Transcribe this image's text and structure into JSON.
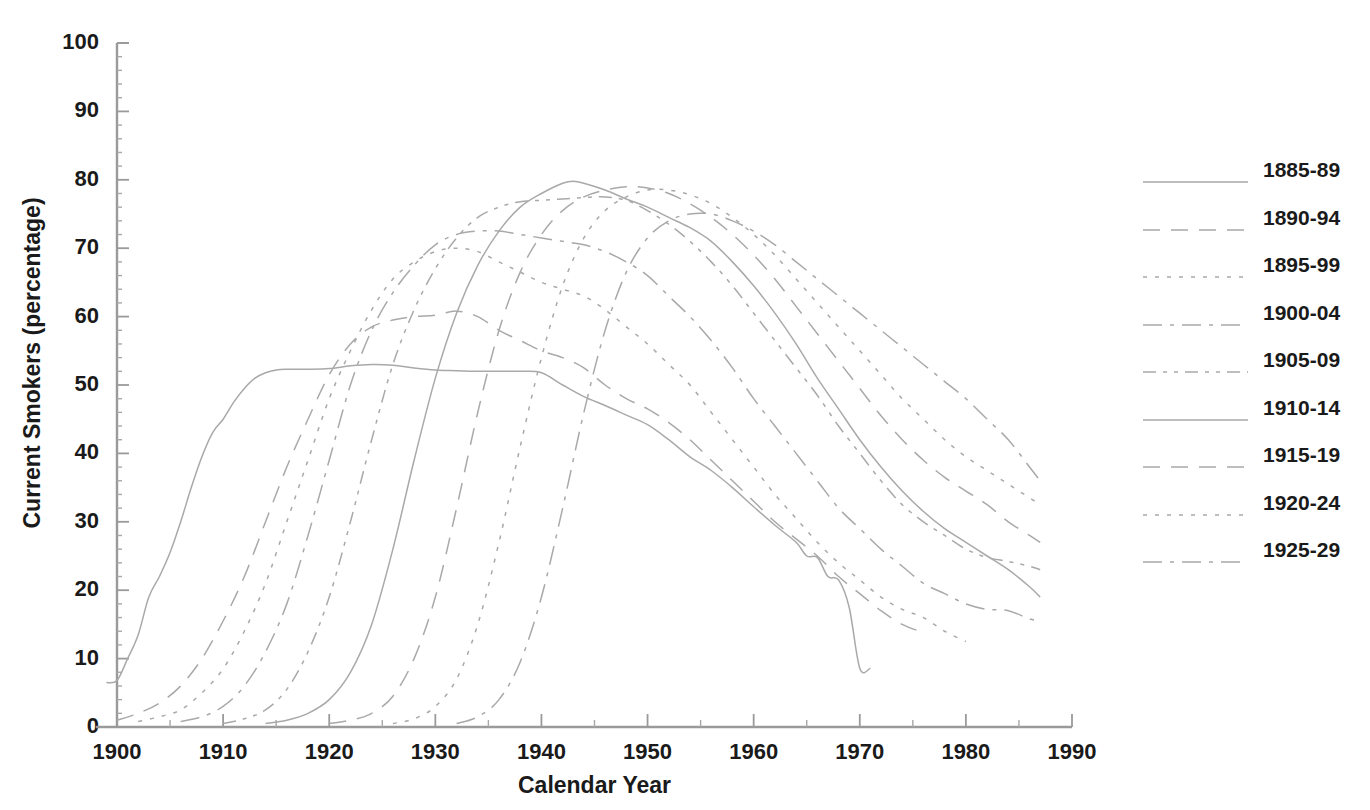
{
  "chart_data": {
    "type": "line",
    "title": "",
    "xlabel": "Calendar Year",
    "ylabel": "Current Smokers (percentage)",
    "xlim": [
      1898,
      1990
    ],
    "ylim": [
      0,
      100
    ],
    "xticks": [
      1900,
      1910,
      1920,
      1930,
      1940,
      1950,
      1960,
      1970,
      1980,
      1990
    ],
    "xtick_labels": [
      "1900",
      "1910",
      "1920",
      "1930",
      "1940",
      "1950",
      "1960",
      "1970",
      "1980",
      "1990"
    ],
    "xminor_interval": 5,
    "yticks": [
      0,
      10,
      20,
      30,
      40,
      50,
      60,
      70,
      80,
      90,
      100
    ],
    "ytick_labels": [
      "0",
      "10",
      "20",
      "30",
      "40",
      "50",
      "60",
      "70",
      "80",
      "90",
      "100"
    ],
    "yminor_interval": 2,
    "grid": false,
    "legend_position": "right",
    "line_color": "#a9a9a9",
    "series": [
      {
        "name": "1885-89",
        "dash": "solid",
        "x": [
          1899,
          1900,
          1901,
          1902,
          1903,
          1904,
          1905,
          1906,
          1907,
          1908,
          1909,
          1910,
          1911,
          1912,
          1913,
          1914,
          1915,
          1916,
          1918,
          1920,
          1922,
          1924,
          1926,
          1928,
          1930,
          1932,
          1934,
          1936,
          1938,
          1940,
          1942,
          1944,
          1946,
          1948,
          1950,
          1952,
          1954,
          1956,
          1958,
          1960,
          1962,
          1964,
          1965,
          1966,
          1967,
          1968,
          1969,
          1970,
          1971
        ],
        "y": [
          6.5,
          6.8,
          10.0,
          13.5,
          19.0,
          22.0,
          25.5,
          30.0,
          35.0,
          39.5,
          43.0,
          45.0,
          47.5,
          49.5,
          51.0,
          51.8,
          52.2,
          52.3,
          52.3,
          52.4,
          52.8,
          53.0,
          52.9,
          52.5,
          52.2,
          52.1,
          52.0,
          52.0,
          52.0,
          51.8,
          50.0,
          48.3,
          47.0,
          45.6,
          44.2,
          42.0,
          39.5,
          37.5,
          35.0,
          32.2,
          29.5,
          27.0,
          25.0,
          24.8,
          22.0,
          21.5,
          17.5,
          8.6,
          8.6
        ]
      },
      {
        "name": "1890-94",
        "dash": "dashed",
        "x": [
          1900,
          1902,
          1904,
          1906,
          1908,
          1910,
          1912,
          1914,
          1916,
          1918,
          1920,
          1922,
          1924,
          1926,
          1928,
          1930,
          1932,
          1934,
          1936,
          1938,
          1940,
          1942,
          1944,
          1946,
          1948,
          1950,
          1952,
          1954,
          1956,
          1958,
          1960,
          1962,
          1964,
          1966,
          1968,
          1970,
          1972,
          1974,
          1976
        ],
        "y": [
          1.0,
          2.0,
          3.5,
          6.0,
          10.0,
          15.5,
          22.0,
          30.0,
          38.0,
          45.0,
          51.5,
          56.0,
          58.5,
          59.5,
          60.0,
          60.2,
          60.8,
          60.0,
          58.0,
          56.5,
          55.0,
          54.0,
          52.5,
          50.0,
          48.0,
          46.5,
          44.5,
          42.0,
          39.0,
          36.0,
          33.0,
          30.0,
          27.5,
          25.0,
          22.0,
          19.5,
          17.0,
          15.0,
          13.8
        ]
      },
      {
        "name": "1895-99",
        "dash": "dotted",
        "x": [
          1902,
          1904,
          1906,
          1908,
          1910,
          1912,
          1914,
          1916,
          1918,
          1920,
          1922,
          1924,
          1926,
          1928,
          1930,
          1932,
          1934,
          1936,
          1938,
          1940,
          1942,
          1944,
          1946,
          1948,
          1950,
          1952,
          1954,
          1956,
          1958,
          1960,
          1962,
          1964,
          1966,
          1968,
          1970,
          1972,
          1974,
          1976,
          1978,
          1980
        ],
        "y": [
          0.8,
          1.5,
          2.5,
          5.0,
          8.5,
          14.0,
          21.0,
          30.0,
          39.0,
          48.0,
          55.0,
          61.0,
          65.5,
          68.0,
          69.5,
          70.0,
          69.5,
          68.0,
          66.5,
          65.0,
          64.0,
          63.0,
          61.0,
          58.5,
          56.0,
          53.0,
          50.0,
          46.0,
          42.0,
          38.0,
          34.0,
          30.5,
          27.0,
          24.0,
          21.5,
          19.0,
          17.2,
          16.0,
          14.0,
          12.5
        ]
      },
      {
        "name": "1900-04",
        "dash": "dashdot",
        "x": [
          1906,
          1908,
          1910,
          1912,
          1914,
          1916,
          1918,
          1920,
          1922,
          1924,
          1926,
          1928,
          1930,
          1932,
          1934,
          1936,
          1938,
          1940,
          1942,
          1944,
          1946,
          1948,
          1950,
          1952,
          1954,
          1956,
          1958,
          1960,
          1962,
          1964,
          1966,
          1968,
          1970,
          1972,
          1974,
          1976,
          1978,
          1980,
          1982,
          1984,
          1986,
          1987
        ],
        "y": [
          0.8,
          1.5,
          3.0,
          6.0,
          11.0,
          18.0,
          28.0,
          39.0,
          50.0,
          58.0,
          63.5,
          67.5,
          70.5,
          72.0,
          72.5,
          72.5,
          72.0,
          71.5,
          71.0,
          70.5,
          69.5,
          68.0,
          66.0,
          63.0,
          60.0,
          56.5,
          52.5,
          48.0,
          44.0,
          40.0,
          36.0,
          32.0,
          29.0,
          26.0,
          23.5,
          21.0,
          19.5,
          18.0,
          17.2,
          17.0,
          15.8,
          15.5
        ]
      },
      {
        "name": "1905-09",
        "dash": "dashdotdot",
        "x": [
          1910,
          1912,
          1914,
          1916,
          1918,
          1920,
          1922,
          1924,
          1926,
          1928,
          1930,
          1932,
          1934,
          1936,
          1938,
          1940,
          1942,
          1944,
          1946,
          1948,
          1950,
          1952,
          1954,
          1956,
          1958,
          1960,
          1962,
          1964,
          1966,
          1968,
          1970,
          1972,
          1974,
          1976,
          1978,
          1980,
          1982,
          1984,
          1986,
          1987
        ],
        "y": [
          0.5,
          1.2,
          2.5,
          5.5,
          11.0,
          19.0,
          30.0,
          42.0,
          53.0,
          61.0,
          67.0,
          71.5,
          74.5,
          76.0,
          76.8,
          77.0,
          77.2,
          77.4,
          77.5,
          77.0,
          75.5,
          73.5,
          71.0,
          68.0,
          64.5,
          60.5,
          56.5,
          52.5,
          48.5,
          44.0,
          40.0,
          36.0,
          32.5,
          30.0,
          28.0,
          26.0,
          24.8,
          24.2,
          23.5,
          23.0
        ]
      },
      {
        "name": "1910-14",
        "dash": "solid",
        "x": [
          1914,
          1916,
          1918,
          1920,
          1922,
          1924,
          1926,
          1928,
          1930,
          1932,
          1934,
          1936,
          1938,
          1940,
          1942,
          1943,
          1944,
          1946,
          1948,
          1950,
          1952,
          1954,
          1956,
          1958,
          1960,
          1962,
          1964,
          1966,
          1968,
          1970,
          1972,
          1974,
          1976,
          1978,
          1980,
          1982,
          1984,
          1986,
          1987
        ],
        "y": [
          0.5,
          1.0,
          2.0,
          4.0,
          8.0,
          15.0,
          26.0,
          39.0,
          51.0,
          60.5,
          67.5,
          72.5,
          76.0,
          78.0,
          79.5,
          79.8,
          79.5,
          78.5,
          77.2,
          76.0,
          74.5,
          73.0,
          71.0,
          68.0,
          64.5,
          60.5,
          56.0,
          51.0,
          46.5,
          42.0,
          38.0,
          34.5,
          31.5,
          29.0,
          27.0,
          25.0,
          23.0,
          20.5,
          19.0
        ]
      },
      {
        "name": "1915-19",
        "dash": "dashed",
        "x": [
          1920,
          1922,
          1924,
          1926,
          1928,
          1930,
          1932,
          1934,
          1936,
          1938,
          1940,
          1942,
          1944,
          1946,
          1948,
          1950,
          1952,
          1954,
          1956,
          1958,
          1960,
          1962,
          1964,
          1966,
          1968,
          1970,
          1972,
          1974,
          1976,
          1978,
          1980,
          1982,
          1984,
          1986,
          1987
        ],
        "y": [
          0.5,
          1.0,
          2.0,
          4.5,
          10.0,
          19.0,
          32.0,
          46.0,
          58.0,
          66.5,
          72.0,
          75.5,
          77.5,
          78.5,
          79.0,
          78.8,
          78.0,
          76.5,
          74.5,
          72.0,
          69.0,
          65.5,
          61.5,
          57.5,
          53.5,
          49.5,
          45.5,
          42.0,
          39.0,
          36.5,
          34.5,
          32.5,
          30.0,
          28.0,
          27.0
        ]
      },
      {
        "name": "1920-24",
        "dash": "dotted",
        "x": [
          1926,
          1928,
          1930,
          1932,
          1934,
          1936,
          1938,
          1940,
          1942,
          1944,
          1946,
          1948,
          1950,
          1952,
          1954,
          1956,
          1958,
          1960,
          1962,
          1964,
          1966,
          1968,
          1970,
          1972,
          1974,
          1976,
          1978,
          1980,
          1982,
          1984,
          1986,
          1987
        ],
        "y": [
          0.5,
          1.2,
          3.0,
          7.0,
          15.0,
          27.0,
          41.0,
          54.0,
          64.5,
          71.5,
          75.5,
          77.5,
          78.5,
          78.5,
          77.8,
          76.5,
          74.5,
          72.0,
          69.0,
          65.5,
          62.0,
          58.5,
          55.0,
          51.5,
          48.0,
          45.0,
          42.0,
          39.5,
          37.5,
          35.5,
          33.5,
          32.5
        ]
      },
      {
        "name": "1925-29",
        "dash": "dashdot",
        "x": [
          1932,
          1934,
          1936,
          1938,
          1940,
          1942,
          1944,
          1946,
          1948,
          1950,
          1952,
          1954,
          1956,
          1958,
          1960,
          1962,
          1964,
          1966,
          1968,
          1970,
          1972,
          1974,
          1976,
          1978,
          1980,
          1982,
          1984,
          1986,
          1987
        ],
        "y": [
          0.5,
          1.5,
          4.0,
          9.5,
          19.0,
          32.0,
          46.0,
          58.0,
          66.5,
          71.5,
          74.0,
          75.0,
          75.0,
          74.0,
          72.5,
          70.5,
          68.0,
          65.5,
          63.0,
          60.5,
          58.0,
          55.5,
          53.0,
          50.5,
          48.0,
          45.0,
          42.0,
          38.0,
          36.0
        ]
      }
    ]
  },
  "legend": {
    "items": [
      {
        "label": "1885-89",
        "dash": "solid"
      },
      {
        "label": "1890-94",
        "dash": "dashed"
      },
      {
        "label": "1895-99",
        "dash": "dotted"
      },
      {
        "label": "1900-04",
        "dash": "dashdot"
      },
      {
        "label": "1905-09",
        "dash": "dashdotdot"
      },
      {
        "label": "1910-14",
        "dash": "solid"
      },
      {
        "label": "1915-19",
        "dash": "dashed"
      },
      {
        "label": "1920-24",
        "dash": "dotted"
      },
      {
        "label": "1925-29",
        "dash": "dashdot"
      }
    ]
  }
}
